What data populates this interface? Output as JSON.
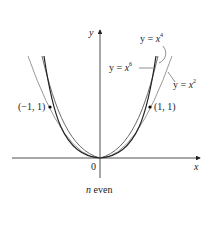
{
  "figure": {
    "caption_n": "n",
    "caption_rest": " even",
    "axis_x_label": "x",
    "axis_y_label": "y",
    "origin_label": "0",
    "points": [
      {
        "label": "(−1, 1)"
      },
      {
        "label": "(1, 1)"
      }
    ],
    "curves": [
      {
        "label_prefix": "y = ",
        "label_var": "x",
        "label_exp": "2",
        "color": "#9a9a9a"
      },
      {
        "label_prefix": "y = ",
        "label_var": "x",
        "label_exp": "4",
        "color": "#6a6a6a"
      },
      {
        "label_prefix": "y = ",
        "label_var": "x",
        "label_exp": "6",
        "color": "#222222"
      }
    ]
  }
}
